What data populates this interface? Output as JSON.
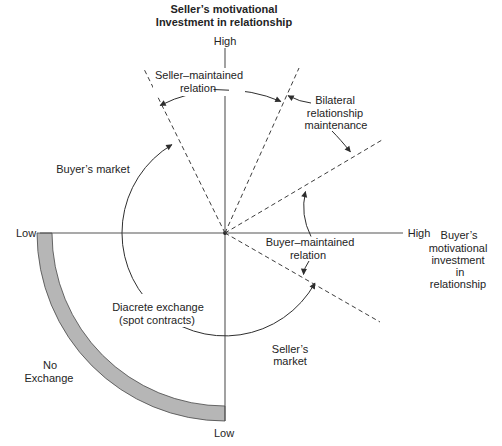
{
  "title": {
    "line1": "Seller’s motivational",
    "line2": "Investment in relationship"
  },
  "axes": {
    "vertical_top_label": "High",
    "vertical_bottom_label": "Low",
    "horizontal_left_label": "Low",
    "horizontal_right_label": "High",
    "horizontal_axis_name_lines": [
      "Buyer’s",
      "motivational",
      "investment",
      "in",
      "relationship"
    ]
  },
  "labels": {
    "seller_maintained": [
      "Seller–maintained",
      "relation"
    ],
    "bilateral": [
      "Bilateral",
      "relationship",
      "maintenance"
    ],
    "buyers_market": "Buyer’s market",
    "buyer_maintained": [
      "Buyer–maintained",
      "relation"
    ],
    "discrete_exchange": [
      "Diacrete exchange",
      "(spot contracts)"
    ],
    "sellers_market": [
      "Seller’s",
      "market"
    ],
    "no_exchange": [
      "No",
      "Exchange"
    ]
  },
  "colors": {
    "text": "#242424",
    "solid_line": "#2e2e2e",
    "dashed_line": "#3d3d3d",
    "axis_line": "#555555",
    "band_fill": "#b6b6b6",
    "band_stroke": "#474747",
    "background": "#ffffff"
  }
}
